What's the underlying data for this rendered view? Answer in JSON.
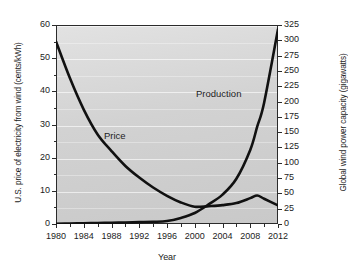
{
  "chart_data": {
    "type": "line",
    "title": "",
    "subtitle": "",
    "xlabel": "Year",
    "ylabel": "U.S. price of electricity from wind (cents/kWh)",
    "y2label": "Global wind power capacity (gigawatts)",
    "xlim": [
      1980,
      2012
    ],
    "ylim": [
      0,
      60
    ],
    "y2lim": [
      0,
      325
    ],
    "xticks": [
      1980,
      1984,
      1988,
      1992,
      1996,
      2000,
      2004,
      2008,
      2012
    ],
    "xticklabels": [
      "1980",
      "1984",
      "1988",
      "1992",
      "1996",
      "2000",
      "2004",
      "2008",
      "2012"
    ],
    "xminorticks": [
      1982,
      1986,
      1990,
      1994,
      1998,
      2002,
      2006,
      2010
    ],
    "yticks": [
      0,
      10,
      20,
      30,
      40,
      50,
      60
    ],
    "yticklabels": [
      "0",
      "10",
      "20",
      "30",
      "40",
      "50",
      "60"
    ],
    "yminorticks": [
      5,
      15,
      25,
      35,
      45,
      55
    ],
    "y2ticks": [
      0,
      25,
      50,
      75,
      100,
      125,
      150,
      175,
      200,
      225,
      250,
      275,
      300,
      325
    ],
    "y2ticklabels": [
      "0",
      "25",
      "50",
      "75",
      "100",
      "125",
      "150",
      "175",
      "200",
      "225",
      "250",
      "275",
      "300",
      "325"
    ],
    "grid": true,
    "grid_orientation": "horizontal",
    "legend": "inline-annotations",
    "legend_position": "inline",
    "x": [
      1980,
      1982,
      1984,
      1986,
      1988,
      1990,
      1992,
      1994,
      1996,
      1998,
      2000,
      2002,
      2004,
      2006,
      2008,
      2009,
      2010,
      2012
    ],
    "series": [
      {
        "name": "Price",
        "axis": "left",
        "units": "cents/kWh",
        "color": "#111111",
        "values": [
          55,
          44,
          34.5,
          27,
          22,
          17.5,
          14,
          11,
          8.5,
          6.5,
          5.2,
          5.4,
          5.7,
          6.3,
          7.8,
          8.6,
          7.6,
          5.6
        ]
      },
      {
        "name": "Production",
        "axis": "right",
        "units": "gigawatts",
        "color": "#111111",
        "values": [
          0.5,
          0.8,
          1.2,
          1.6,
          2.0,
          2.4,
          3.0,
          3.6,
          4.8,
          10.0,
          18.0,
          32.0,
          48.0,
          74.0,
          121.0,
          159.0,
          198.0,
          318.0
        ]
      }
    ],
    "annotations": [
      {
        "text": "Price",
        "series": "Price",
        "x": 1989,
        "y": 23
      },
      {
        "text": "Production",
        "series": "Production",
        "x": 2003,
        "y": 230
      }
    ]
  }
}
